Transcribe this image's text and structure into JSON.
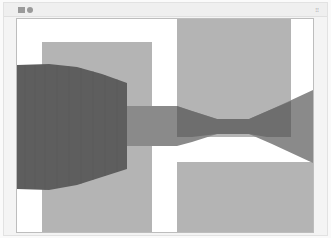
{
  "window": {
    "title_icons": [
      "app-icon",
      "status-dot-icon"
    ],
    "corner_icon": "grip-icon",
    "corner_glyph": "⁝⁝"
  },
  "canvas": {
    "background": "#ffffff",
    "colors": {
      "light_rect": "#b4b4b4",
      "dark_band": "#5e5e5e",
      "mid_band": "#8a8a8a",
      "overlap_band": "#6e6e6e"
    }
  }
}
